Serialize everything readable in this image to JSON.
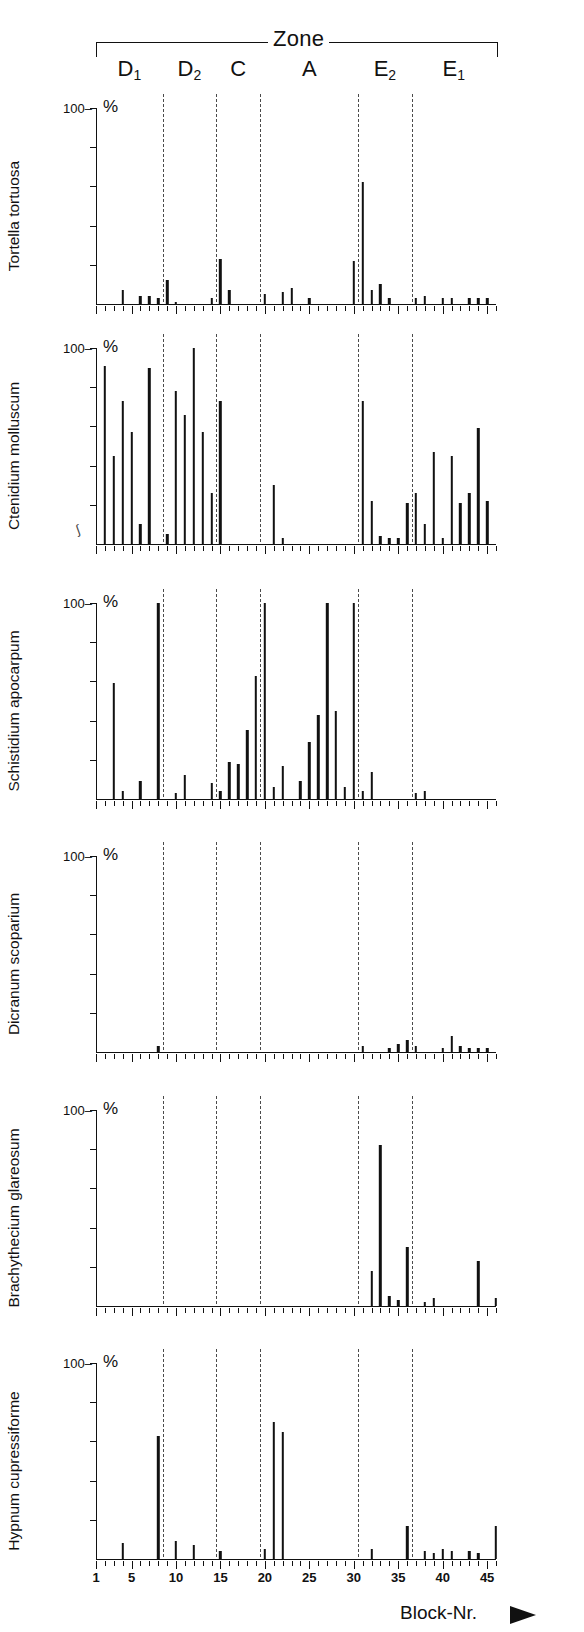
{
  "header": {
    "zone_title": "Zone",
    "zones": [
      {
        "label": "D",
        "sub": "1",
        "start": 1.0,
        "end": 8.5
      },
      {
        "label": "D",
        "sub": "2",
        "start": 8.5,
        "end": 14.5
      },
      {
        "label": "C",
        "sub": "",
        "start": 14.5,
        "end": 19.5
      },
      {
        "label": "A",
        "sub": "",
        "start": 19.5,
        "end": 30.5
      },
      {
        "label": "E",
        "sub": "2",
        "start": 30.5,
        "end": 36.5
      },
      {
        "label": "E",
        "sub": "1",
        "start": 36.5,
        "end": 46.0
      }
    ]
  },
  "axis": {
    "x_title": "Block-Nr.",
    "x_min": 1,
    "x_max": 46,
    "x_tick_labels": [
      1,
      5,
      10,
      15,
      20,
      25,
      30,
      35,
      40,
      45
    ],
    "y_label": "%",
    "y_max_label": "100",
    "y_min": 0,
    "y_max": 100,
    "y_ticks": [
      0,
      20,
      40,
      60,
      80,
      100
    ]
  },
  "zone_boundaries": [
    8.5,
    14.5,
    19.5,
    30.5,
    36.5
  ],
  "chart_data": {
    "type": "bar",
    "title": "Zone",
    "xlabel": "Block-Nr.",
    "ylabel": "%",
    "ylim": [
      0,
      100
    ],
    "xlim": [
      1,
      46
    ],
    "grid": false,
    "legend": "none",
    "x": [
      1,
      2,
      3,
      4,
      5,
      6,
      7,
      8,
      9,
      10,
      11,
      12,
      13,
      14,
      15,
      16,
      17,
      18,
      19,
      20,
      21,
      22,
      23,
      24,
      25,
      26,
      27,
      28,
      29,
      30,
      31,
      32,
      33,
      34,
      35,
      36,
      37,
      38,
      39,
      40,
      41,
      42,
      43,
      44,
      45,
      46
    ],
    "series": [
      {
        "name": "Tortella tortuosa",
        "values": [
          0,
          0,
          0,
          7,
          0,
          4,
          4,
          3,
          12,
          1,
          0,
          0,
          0,
          3,
          23,
          7,
          0,
          0,
          0,
          5,
          0,
          6,
          8,
          0,
          3,
          0,
          0,
          0,
          0,
          22,
          62,
          7,
          10,
          3,
          0,
          0,
          3,
          4,
          0,
          3,
          3,
          0,
          3,
          3,
          3,
          0
        ]
      },
      {
        "name": "Ctenidium molluscum",
        "values": [
          0,
          91,
          45,
          73,
          57,
          10,
          90,
          0,
          5,
          78,
          66,
          100,
          57,
          26,
          73,
          0,
          0,
          0,
          0,
          0,
          30,
          3,
          0,
          0,
          0,
          0,
          0,
          0,
          0,
          0,
          73,
          22,
          4,
          3,
          3,
          21,
          26,
          10,
          47,
          3,
          45,
          21,
          26,
          59,
          22,
          0
        ]
      },
      {
        "name": "Schistidium apocarpum",
        "values": [
          0,
          0,
          59,
          4,
          0,
          9,
          0,
          100,
          0,
          3,
          12,
          0,
          0,
          8,
          4,
          19,
          18,
          35,
          63,
          100,
          6,
          17,
          0,
          9,
          29,
          43,
          100,
          45,
          6,
          100,
          4,
          14,
          0,
          0,
          0,
          0,
          3,
          4,
          0,
          0,
          0,
          0,
          0,
          0,
          0,
          0
        ]
      },
      {
        "name": "Dicranum scoparium",
        "values": [
          0,
          0,
          0,
          0,
          0,
          0,
          0,
          3,
          0,
          0,
          0,
          0,
          0,
          0,
          0,
          0,
          0,
          0,
          0,
          0,
          0,
          0,
          0,
          0,
          0,
          0,
          0,
          0,
          0,
          0,
          3,
          0,
          0,
          2,
          4,
          6,
          3,
          0,
          0,
          2,
          8,
          3,
          2,
          2,
          2,
          0
        ]
      },
      {
        "name": "Brachythecium glareosum",
        "values": [
          0,
          0,
          0,
          0,
          0,
          0,
          0,
          0,
          0,
          0,
          0,
          0,
          0,
          0,
          0,
          0,
          0,
          0,
          0,
          0,
          0,
          0,
          0,
          0,
          0,
          0,
          0,
          0,
          0,
          0,
          0,
          18,
          82,
          5,
          3,
          30,
          0,
          2,
          4,
          0,
          0,
          0,
          0,
          23,
          0,
          4
        ]
      },
      {
        "name": "Hypnum cupressiforme",
        "values": [
          0,
          0,
          0,
          8,
          0,
          0,
          0,
          63,
          0,
          9,
          0,
          7,
          0,
          0,
          4,
          0,
          0,
          0,
          0,
          5,
          70,
          65,
          0,
          0,
          0,
          0,
          0,
          0,
          0,
          0,
          0,
          5,
          0,
          0,
          0,
          17,
          0,
          4,
          3,
          5,
          4,
          0,
          4,
          3,
          0,
          17
        ]
      }
    ]
  },
  "panels": [
    {
      "species": "Tortella tortuosa",
      "y_top_label": "100",
      "y_unit": "%"
    },
    {
      "species": "Ctenidium molluscum",
      "y_top_label": "100",
      "y_unit": "%"
    },
    {
      "species": "Schistidium apocarpum",
      "y_top_label": "100",
      "y_unit": "%"
    },
    {
      "species": "Dicranum scoparium",
      "y_top_label": "100",
      "y_unit": "%"
    },
    {
      "species": "Brachythecium glareosum",
      "y_top_label": "100",
      "y_unit": "%"
    },
    {
      "species": "Hypnum cupressiforme",
      "y_top_label": "100",
      "y_unit": "%"
    }
  ]
}
